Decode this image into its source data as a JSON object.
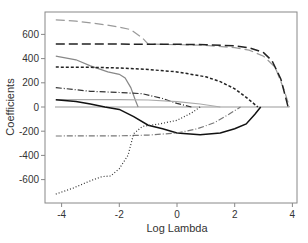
{
  "chart_data": {
    "type": "line",
    "title": "",
    "xlabel": "Log Lambda",
    "ylabel": "Coefficients",
    "xlim": [
      -4.3,
      4.2
    ],
    "ylim": [
      -790,
      790
    ],
    "xticks": [
      -4,
      -2,
      0,
      2,
      4
    ],
    "yticks": [
      -600,
      -400,
      -200,
      0,
      200,
      400,
      600
    ],
    "grid": false,
    "legend": null,
    "series": [
      {
        "name": "coef-1",
        "style": "long-dash",
        "color": "#9a9a9a",
        "x": [
          -4.2,
          -3.5,
          -2.5,
          -2.0,
          -1.6,
          -1.2,
          -1.0,
          0.0,
          1.0,
          2.0,
          2.5,
          3.0,
          3.4,
          3.7,
          3.9
        ],
        "y": [
          720,
          710,
          680,
          660,
          640,
          570,
          520,
          515,
          510,
          490,
          470,
          420,
          330,
          150,
          0
        ]
      },
      {
        "name": "coef-2",
        "style": "long-dash",
        "color": "#222222",
        "x": [
          -4.2,
          -2.0,
          0.0,
          1.0,
          2.0,
          2.5,
          3.0,
          3.3,
          3.6,
          3.85
        ],
        "y": [
          520,
          520,
          518,
          515,
          505,
          490,
          450,
          380,
          230,
          0
        ]
      },
      {
        "name": "coef-3",
        "style": "solid",
        "color": "#888888",
        "x": [
          -4.2,
          -3.5,
          -3.0,
          -2.4,
          -2.0,
          -1.8,
          -1.6,
          -1.45,
          -1.35
        ],
        "y": [
          420,
          390,
          340,
          290,
          270,
          240,
          160,
          60,
          0
        ]
      },
      {
        "name": "coef-4",
        "style": "short-dash",
        "color": "#222222",
        "x": [
          -4.2,
          -3.0,
          -2.0,
          -1.0,
          0.0,
          1.0,
          1.5,
          2.0,
          2.4,
          2.8
        ],
        "y": [
          330,
          328,
          322,
          310,
          290,
          250,
          210,
          150,
          80,
          0
        ]
      },
      {
        "name": "coef-5",
        "style": "dash-dot",
        "color": "#333333",
        "x": [
          -4.2,
          -3.0,
          -2.0,
          -1.2,
          -0.5,
          0.0,
          0.5
        ],
        "y": [
          160,
          130,
          120,
          110,
          70,
          30,
          0
        ]
      },
      {
        "name": "coef-6",
        "style": "solid",
        "color": "#aaaaaa",
        "x": [
          -4.2,
          -2.0,
          -1.0,
          0.0,
          0.8,
          1.5
        ],
        "y": [
          60,
          60,
          58,
          45,
          25,
          0
        ]
      },
      {
        "name": "coef-7",
        "style": "solid",
        "color": "#111111",
        "x": [
          -4.2,
          -3.5,
          -3.0,
          -2.5,
          -2.0,
          -1.5,
          -1.0,
          -0.5,
          0.0,
          0.8,
          1.5,
          2.0,
          2.4,
          2.7,
          2.9
        ],
        "y": [
          60,
          45,
          25,
          0,
          -20,
          -80,
          -150,
          -180,
          -215,
          -230,
          -215,
          -180,
          -140,
          -60,
          0
        ]
      },
      {
        "name": "coef-8",
        "style": "dash-dot",
        "color": "#777777",
        "x": [
          -4.2,
          -2.0,
          -1.0,
          0.0,
          0.7,
          1.3,
          1.8,
          2.2
        ],
        "y": [
          -240,
          -238,
          -232,
          -215,
          -180,
          -130,
          -60,
          0
        ]
      },
      {
        "name": "coef-9",
        "style": "dotted",
        "color": "#333333",
        "x": [
          -4.2,
          -3.6,
          -3.0,
          -2.6,
          -2.3,
          -2.0,
          -1.7,
          -1.5,
          -1.2,
          -0.6,
          0.0,
          0.5,
          0.8
        ],
        "y": [
          -720,
          -670,
          -610,
          -575,
          -570,
          -510,
          -400,
          -220,
          -160,
          -140,
          -110,
          -50,
          0
        ]
      }
    ]
  },
  "axes": {
    "x_label": "Log Lambda",
    "y_label": "Coefficients",
    "x_tick_labels": [
      "-4",
      "-2",
      "0",
      "2",
      "4"
    ],
    "y_tick_labels": [
      "600",
      "400",
      "200",
      "0",
      "-200",
      "-400",
      "-600"
    ]
  }
}
